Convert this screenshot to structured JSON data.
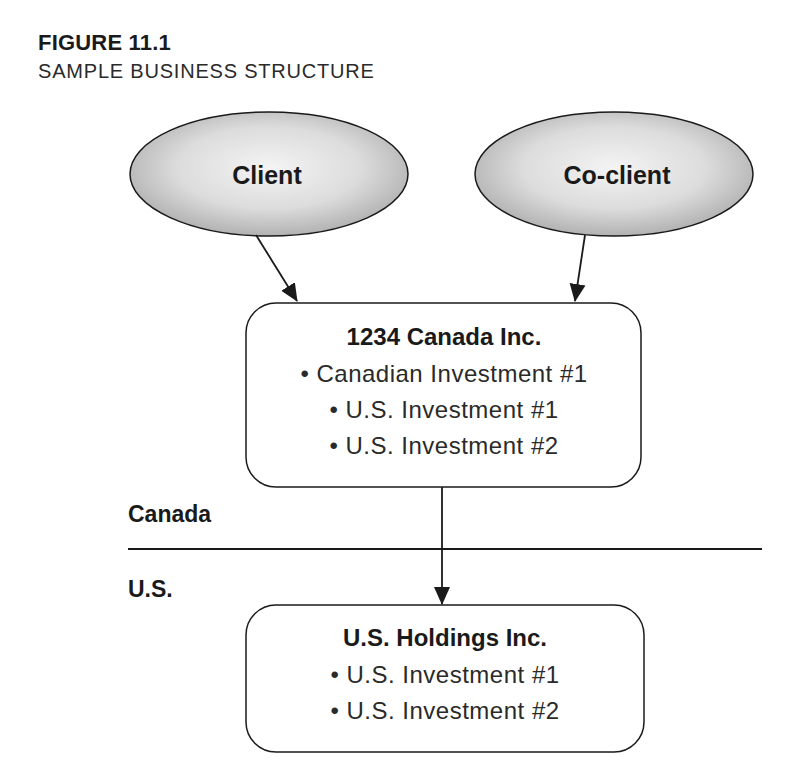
{
  "figure": {
    "number": "FIGURE 11.1",
    "title": "SAMPLE BUSINESS STRUCTURE"
  },
  "nodes": {
    "client": {
      "label": "Client"
    },
    "coclient": {
      "label": "Co-client"
    },
    "canada_corp": {
      "title": "1234 Canada Inc.",
      "items": [
        "• Canadian Investment #1",
        "• U.S. Investment #1",
        "• U.S. Investment #2"
      ]
    },
    "us_corp": {
      "title": "U.S. Holdings Inc.",
      "items": [
        "• U.S. Investment #1",
        "• U.S. Investment #2"
      ]
    }
  },
  "regions": {
    "top": "Canada",
    "bottom": "U.S."
  },
  "colors": {
    "stroke": "#1a1a1a",
    "ellipse_fill_center": "#f2f2f2",
    "ellipse_fill_edge": "#b8b8b8",
    "box_fill": "#ffffff"
  }
}
